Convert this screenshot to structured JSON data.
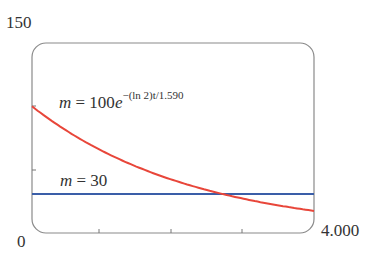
{
  "chart_data": {
    "type": "line",
    "title": "",
    "xlabel": "t",
    "ylabel": "m",
    "xlim": [
      0,
      4.0
    ],
    "ylim": [
      0,
      150
    ],
    "x_tick_labels": {
      "min": "0",
      "max": "4.000"
    },
    "y_tick_labels": {
      "max": "150"
    },
    "x_ticks": [
      1,
      2,
      3
    ],
    "y_ticks": [
      50,
      100
    ],
    "grid": false,
    "series": [
      {
        "name": "m = 100e^{-(ln 2)t/1.590}",
        "type": "function",
        "formula": "100*exp(-ln(2)*t/1.590)",
        "color": "#e8463a",
        "x": [
          0,
          0.5,
          1.0,
          1.5,
          2.0,
          2.5,
          2.762,
          3.0,
          3.5,
          4.0
        ],
        "values": [
          100,
          80.4,
          64.7,
          52.0,
          41.8,
          33.6,
          30.0,
          27.0,
          21.7,
          17.5
        ]
      },
      {
        "name": "m = 30",
        "type": "constant",
        "color": "#3a5ea8",
        "x": [
          0,
          4.0
        ],
        "values": [
          30,
          30
        ]
      }
    ],
    "annotations": [
      {
        "text": "m = 100e^{-(ln 2)t/1.590}",
        "near": "red curve, upper left"
      },
      {
        "text": "m = 30",
        "near": "blue line, left"
      }
    ],
    "intersection": {
      "t": 2.762,
      "m": 30
    }
  },
  "labels": {
    "y_max": "150",
    "origin": "0",
    "x_max": "4.000",
    "eq1_var": "m",
    "eq1_eq": " = 100",
    "eq1_e": "e",
    "eq1_exp": "−(ln 2)t/1.590",
    "eq2_var": "m",
    "eq2_rest": " = 30"
  }
}
